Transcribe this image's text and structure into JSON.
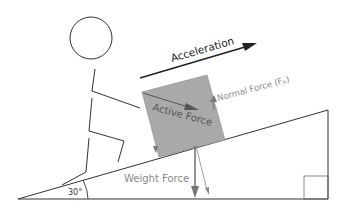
{
  "diagram": {
    "labels": {
      "acceleration": "Acceleration",
      "normal_force": "Normal Force (F",
      "normal_force_sub": "n",
      "normal_force_close": ")",
      "active_force": "Active Force",
      "weight_force": "Weight Force",
      "angle": "30°"
    },
    "colors": {
      "line": "#333333",
      "box_fill": "#a8a8a8",
      "label_gray": "#888888",
      "arrow_gray": "#777777",
      "acceleration_arrow": "#222222"
    }
  }
}
